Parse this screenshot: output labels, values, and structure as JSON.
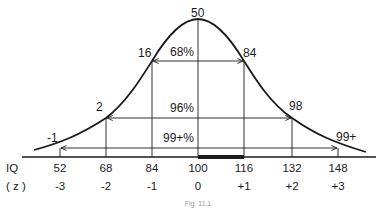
{
  "figure": {
    "caption": "Fig. 11.1",
    "type": "normal-distribution-diagram"
  },
  "axis": {
    "iq_label": "IQ",
    "z_label": "( z )",
    "ticks": [
      {
        "iq": "52",
        "z": "-3"
      },
      {
        "iq": "68",
        "z": "-2"
      },
      {
        "iq": "84",
        "z": "-1"
      },
      {
        "iq": "100",
        "z": "0"
      },
      {
        "iq": "116",
        "z": "+1"
      },
      {
        "iq": "132",
        "z": "+2"
      },
      {
        "iq": "148",
        "z": "+3"
      }
    ]
  },
  "percentile_labels": {
    "minus3": "-1",
    "minus2": "2",
    "minus1": "16",
    "mean": "50",
    "plus1": "84",
    "plus2": "98",
    "plus3": "99+"
  },
  "ranges": {
    "one_sd": "68%",
    "two_sd": "96%",
    "three_sd": "99+%"
  },
  "highlight": {
    "from_iq": "100",
    "to_iq": "116"
  },
  "colors": {
    "ink": "#1a1a1a",
    "background": "#ffffff"
  }
}
